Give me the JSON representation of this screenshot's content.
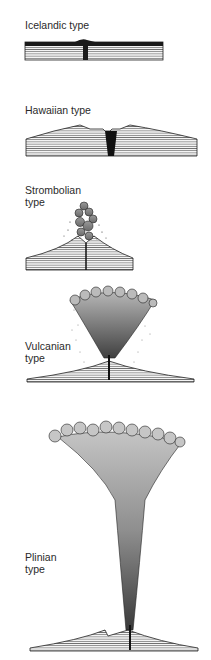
{
  "panels": [
    {
      "id": "icelandic",
      "label": "Icelandic type"
    },
    {
      "id": "hawaiian",
      "label": "Hawaiian type"
    },
    {
      "id": "strombolian",
      "label": "Strombolian\ntype"
    },
    {
      "id": "vulcanian",
      "label": "Vulcanian\ntype"
    },
    {
      "id": "plinian",
      "label": "Plinian\ntype"
    }
  ],
  "colors": {
    "ink": "#1a1a1a",
    "plume_light": "#b8b8b8",
    "plume_mid": "#8a8a8a",
    "plume_dark": "#4a4a4a",
    "strata": "#555555"
  }
}
